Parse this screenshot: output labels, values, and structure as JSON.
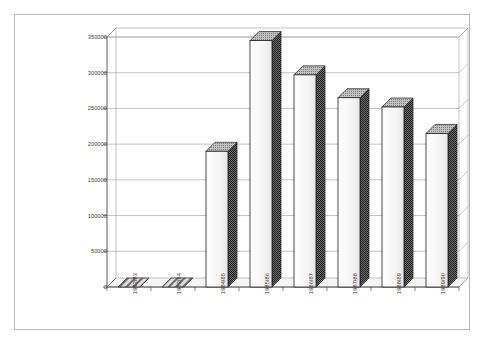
{
  "chart_data": {
    "type": "bar",
    "title": "",
    "subtitle": "",
    "xlabel": "",
    "ylabel": "",
    "categories": [
      "1982/83",
      "1983/84",
      "1984/85",
      "1985/86",
      "1986/87",
      "1987/88",
      "1988/89",
      "1989/90"
    ],
    "values": [
      0,
      0,
      190000,
      345000,
      297000,
      265000,
      252000,
      215000
    ],
    "ylim": [
      0,
      350000
    ],
    "ytick_labels": [
      "0",
      "50000",
      "100000",
      "150000",
      "200000",
      "250000",
      "300000",
      "350000"
    ],
    "ytick_values": [
      0,
      50000,
      100000,
      150000,
      200000,
      250000,
      300000,
      350000
    ],
    "grid": true,
    "legend": false,
    "legend_position": "none",
    "style": "3d-bar-grayscale",
    "colors": {
      "bar_front": "#f2f2f2",
      "bar_side": "#5a5a5a",
      "bar_top": "#9a9a9a",
      "bar_outline": "#1f1f1f",
      "grid_line": "#9a9a9a",
      "axis_line": "#4a4a4a",
      "frame": "#b8b8b8",
      "floor": "#e8e8e8",
      "text": "#3a3a3a",
      "background": "#ffffff"
    }
  }
}
